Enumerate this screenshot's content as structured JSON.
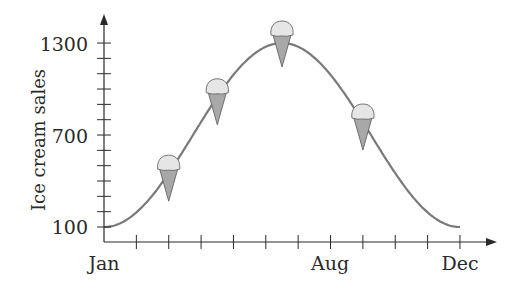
{
  "chart_data": {
    "type": "line",
    "title": "",
    "xlabel": "",
    "ylabel": "Ice cream sales",
    "x_tick_labels": [
      {
        "label": "Jan",
        "month_index": 0
      },
      {
        "label": "Aug",
        "month_index": 7
      },
      {
        "label": "Dec",
        "month_index": 11
      }
    ],
    "y_tick_labels": [
      100,
      700,
      1300
    ],
    "ylim": [
      100,
      1300
    ],
    "y_minor_tick_step": 100,
    "x": [
      "Jan",
      "Feb",
      "Mar",
      "Apr",
      "May",
      "Jun",
      "Jul",
      "Aug",
      "Sep",
      "Oct",
      "Nov",
      "Dec"
    ],
    "series": [
      {
        "name": "Ice cream sales",
        "values": [
          100,
          195,
          451,
          785,
          1092,
          1276,
          1276,
          1092,
          785,
          451,
          195,
          100
        ],
        "color": "#7a7a7a"
      }
    ],
    "annotations": [
      {
        "type": "ice-cream-cone",
        "x": 2.0,
        "y": 451
      },
      {
        "type": "ice-cream-cone",
        "x": 3.5,
        "y": 949
      },
      {
        "type": "ice-cream-cone",
        "x": 5.5,
        "y": 1300
      },
      {
        "type": "ice-cream-cone",
        "x": 8.0,
        "y": 785
      }
    ],
    "grid": false,
    "legend": null
  },
  "labels": {
    "y_axis_title": "Ice cream sales",
    "y_1300": "1300",
    "y_700": "700",
    "y_100": "100",
    "x_jan": "Jan",
    "x_aug": "Aug",
    "x_dec": "Dec"
  },
  "colors": {
    "axis": "#2a2a2a",
    "curve": "#7a7a7a",
    "cone": "#a8a8a8",
    "scoop": "#e6e6e6"
  }
}
